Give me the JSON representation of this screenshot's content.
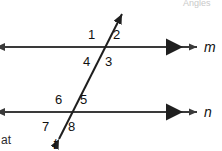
{
  "figure": {
    "title_fragment": "Angles",
    "bottom_left_fragment": "at",
    "background_color": "#ffffff",
    "stroke_color": "#3a3a3a",
    "text_color": "#111111"
  },
  "lines": {
    "parallel_top": {
      "name": "m",
      "y": 47,
      "x_start": 4,
      "x_end": 198
    },
    "parallel_bottom": {
      "name": "n",
      "y": 112,
      "x_start": 4,
      "x_end": 198
    },
    "transversal": {
      "name": "t",
      "x_top": 123,
      "y_top": 12,
      "x_bottom": 58,
      "y_bottom": 141
    }
  },
  "intersections": {
    "with_m": {
      "x": 105,
      "y": 47
    },
    "with_n": {
      "x": 72,
      "y": 112
    }
  },
  "angles": [
    {
      "id": "1",
      "label": "1",
      "x": 88,
      "y": 28
    },
    {
      "id": "2",
      "label": "2",
      "x": 113,
      "y": 28
    },
    {
      "id": "3",
      "label": "3",
      "x": 105,
      "y": 55
    },
    {
      "id": "4",
      "label": "4",
      "x": 83,
      "y": 55
    },
    {
      "id": "5",
      "label": "5",
      "x": 80,
      "y": 93
    },
    {
      "id": "6",
      "label": "6",
      "x": 55,
      "y": 93
    },
    {
      "id": "7",
      "label": "7",
      "x": 42,
      "y": 120
    },
    {
      "id": "8",
      "label": "8",
      "x": 68,
      "y": 120
    }
  ],
  "line_labels": [
    {
      "id": "m",
      "label": "m",
      "x": 204,
      "y": 40
    },
    {
      "id": "n",
      "label": "n",
      "x": 204,
      "y": 105
    },
    {
      "id": "t",
      "label": "t",
      "x": 53,
      "y": 138
    }
  ]
}
